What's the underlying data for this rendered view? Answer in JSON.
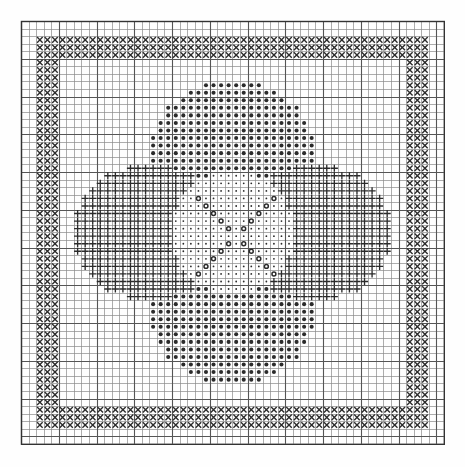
{
  "document": {
    "kind": "cross-stitch-chart",
    "title": "Cross Stitch Pattern Chart",
    "background_color": "#fefefe",
    "ink_color": "#2b2b2b",
    "grid_line_color": "#555555",
    "minor_line_color": "#8a8a8a"
  },
  "grid": {
    "columns": 56,
    "rows": 56,
    "cell_size_px": 7.55,
    "origin_x_px": 21,
    "origin_y_px": 21,
    "heavy_line_every": 5,
    "outer_border": true
  },
  "legend": [
    {
      "key": "X",
      "symbol_name": "cross-stitch-x-symbol",
      "label": "X stitch (border frame)"
    },
    {
      "key": "O",
      "symbol_name": "filled-dot-symbol",
      "label": "Filled dot (top and bottom lobes)"
    },
    {
      "key": "+",
      "symbol_name": "plus-cross-symbol",
      "label": "Plus cross (left and right lobes)"
    },
    {
      "key": ".",
      "symbol_name": "small-dot-symbol",
      "label": "Small dot (centre field)"
    },
    {
      "key": "@",
      "symbol_name": "open-circle-symbol",
      "label": "Open circle (centre accent)"
    }
  ],
  "chart_data": {
    "type": "heatmap",
    "title": "Cross Stitch Pattern Chart",
    "xlabel": "",
    "ylabel": "",
    "columns": 56,
    "rows": 56,
    "symbol_keys": [
      "X",
      "O",
      "+",
      ".",
      "@",
      " "
    ],
    "regions": [
      {
        "name": "border-frame",
        "symbol": "X",
        "shape": "ring",
        "x0": 2,
        "y0": 2,
        "x1": 53,
        "y1": 53,
        "thickness": 3
      },
      {
        "name": "top-lobe",
        "symbol": "O",
        "shape": "ellipse",
        "cx": 28.0,
        "cy": 17.5,
        "rx": 11.0,
        "ry": 9.5
      },
      {
        "name": "bottom-lobe",
        "symbol": "O",
        "shape": "ellipse",
        "cx": 28.0,
        "cy": 38.5,
        "rx": 11.0,
        "ry": 9.5
      },
      {
        "name": "left-lobe",
        "symbol": "+",
        "shape": "ellipse",
        "cx": 17.0,
        "cy": 28.0,
        "rx": 10.0,
        "ry": 9.0
      },
      {
        "name": "right-lobe",
        "symbol": "+",
        "shape": "ellipse",
        "cx": 39.0,
        "cy": 28.0,
        "rx": 10.0,
        "ry": 9.0
      },
      {
        "name": "centre-field",
        "symbol": ".",
        "shape": "ellipse",
        "cx": 28.0,
        "cy": 28.0,
        "rx": 8.0,
        "ry": 8.0
      },
      {
        "name": "centre-accent-x",
        "symbol": "@",
        "shape": "saltire",
        "cx": 28.0,
        "cy": 28.0,
        "arm": 5
      }
    ],
    "counts_estimate": {
      "X": 636,
      "O": 520,
      "+": 470,
      ".": 150,
      "@": 22
    }
  }
}
